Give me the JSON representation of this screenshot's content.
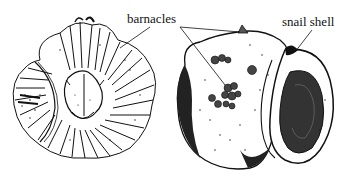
{
  "figure": {
    "type": "scientific illustration",
    "panels": [
      {
        "id": "left",
        "subject": "barnacle (top view)"
      },
      {
        "id": "right",
        "subject": "snail shell with barnacles attached"
      }
    ],
    "labels": {
      "barnacles": "barnacles",
      "snail_shell": "snail shell"
    },
    "colors": {
      "ink": "#111111",
      "background": "#ffffff"
    }
  }
}
